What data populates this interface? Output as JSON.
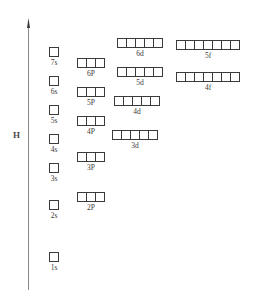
{
  "diagram": {
    "energy_axis": {
      "label": "H",
      "icon": "up-arrow-icon",
      "direction": "up"
    },
    "orbitals": [
      {
        "label": "7s",
        "type": "s",
        "boxes": 1,
        "left": 49,
        "top": 47,
        "column": "s"
      },
      {
        "label": "6s",
        "type": "s",
        "boxes": 1,
        "left": 49,
        "top": 76,
        "column": "s"
      },
      {
        "label": "5s",
        "type": "s",
        "boxes": 1,
        "left": 49,
        "top": 105,
        "column": "s"
      },
      {
        "label": "4s",
        "type": "s",
        "boxes": 1,
        "left": 49,
        "top": 134,
        "column": "s"
      },
      {
        "label": "3s",
        "type": "s",
        "boxes": 1,
        "left": 49,
        "top": 163,
        "column": "s"
      },
      {
        "label": "2s",
        "type": "s",
        "boxes": 1,
        "left": 49,
        "top": 200,
        "column": "s"
      },
      {
        "label": "1s",
        "type": "s",
        "boxes": 1,
        "left": 49,
        "top": 252,
        "column": "s"
      },
      {
        "label": "6P",
        "type": "p",
        "boxes": 3,
        "left": 77,
        "top": 58,
        "column": "p"
      },
      {
        "label": "5P",
        "type": "p",
        "boxes": 3,
        "left": 77,
        "top": 87,
        "column": "p"
      },
      {
        "label": "4P",
        "type": "p",
        "boxes": 3,
        "left": 77,
        "top": 116,
        "column": "p"
      },
      {
        "label": "3P",
        "type": "p",
        "boxes": 3,
        "left": 77,
        "top": 152,
        "column": "p"
      },
      {
        "label": "2P",
        "type": "p",
        "boxes": 3,
        "left": 77,
        "top": 192,
        "column": "p"
      },
      {
        "label": "6d",
        "type": "d",
        "boxes": 5,
        "left": 117,
        "top": 38,
        "column": "d"
      },
      {
        "label": "5d",
        "type": "d",
        "boxes": 5,
        "left": 117,
        "top": 67,
        "column": "d"
      },
      {
        "label": "4d",
        "type": "d",
        "boxes": 5,
        "left": 114,
        "top": 96,
        "column": "d"
      },
      {
        "label": "3d",
        "type": "d",
        "boxes": 5,
        "left": 112,
        "top": 130,
        "column": "d"
      },
      {
        "label": "5f",
        "type": "f",
        "boxes": 7,
        "left": 176,
        "top": 40,
        "column": "f"
      },
      {
        "label": "4f",
        "type": "f",
        "boxes": 7,
        "left": 176,
        "top": 72,
        "column": "f"
      }
    ]
  },
  "colors": {
    "stroke": "#3a3a3a",
    "background": "#ffffff",
    "axis": "#6e6e6e",
    "label": "#4a4a4a"
  }
}
